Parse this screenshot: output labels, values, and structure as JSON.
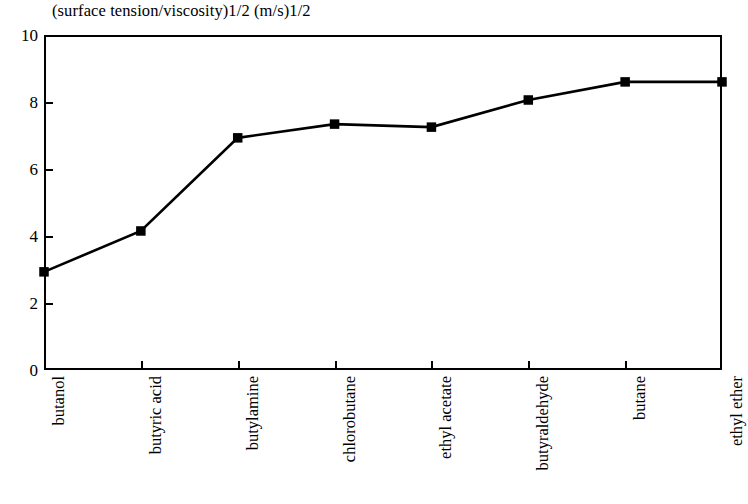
{
  "chart_data": {
    "type": "line",
    "title": "(surface tension/viscosity)1/2 (m/s)1/2",
    "xlabel": "",
    "ylabel": "",
    "categories": [
      "butanol",
      "butyric acid",
      "butylamine",
      "chlorobutane",
      "ethyl acetate",
      "butyraldehyde",
      "butane",
      "ethyl ether"
    ],
    "values": [
      2.93,
      4.15,
      6.93,
      7.34,
      7.25,
      8.06,
      8.6,
      8.6
    ],
    "ylim": [
      0,
      10
    ],
    "yticks": [
      0,
      2,
      4,
      6,
      8,
      10
    ],
    "ytick_labels": [
      "0",
      "2",
      "4",
      "6",
      "8",
      "10"
    ],
    "grid": false,
    "legend": false,
    "marker": "filled-square",
    "line_color": "#000000",
    "marker_color": "#000000",
    "background_color": "#ffffff",
    "axis_color": "#000000"
  }
}
